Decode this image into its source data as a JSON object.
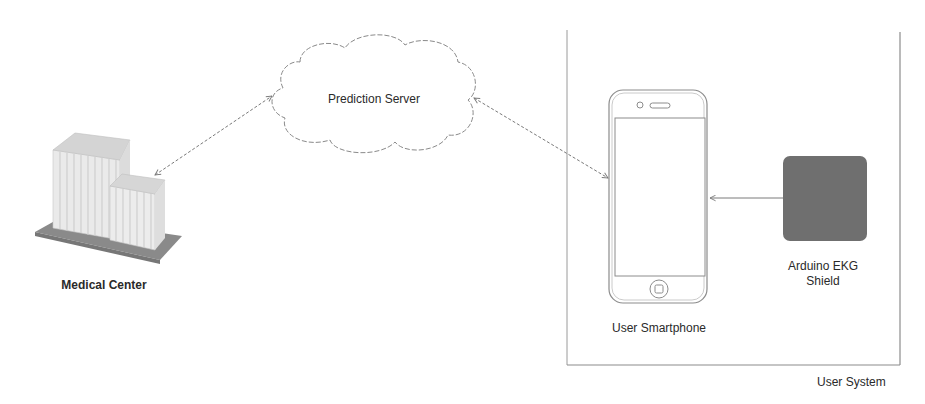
{
  "diagram": {
    "type": "system-architecture",
    "nodes": {
      "prediction_server": {
        "label": "Prediction Server",
        "shape": "cloud"
      },
      "medical_center": {
        "label": "Medical Center",
        "shape": "building-icon"
      },
      "user_smartphone": {
        "label": "User Smartphone",
        "shape": "smartphone-icon"
      },
      "ekg_shield": {
        "label": "Arduino EKG Shield",
        "label_line1": "Arduino EKG",
        "label_line2": "Shield",
        "shape": "rounded-square",
        "fill": "#6f6f6f"
      }
    },
    "groups": {
      "user_system": {
        "label": "User System",
        "contains": [
          "user_smartphone",
          "ekg_shield"
        ]
      }
    },
    "edges": [
      {
        "from": "medical_center",
        "to": "prediction_server",
        "style": "dashed",
        "direction": "bidirectional"
      },
      {
        "from": "prediction_server",
        "to": "user_smartphone",
        "style": "dashed",
        "direction": "bidirectional"
      },
      {
        "from": "ekg_shield",
        "to": "user_smartphone",
        "style": "solid",
        "direction": "forward"
      }
    ],
    "colors": {
      "line": "#7a7a7a",
      "ekg_fill": "#6f6f6f",
      "building_face": "#e4e4e4",
      "building_top": "#d2d2d2",
      "building_base": "#8a8a8a",
      "box_border": "#8c8c8c"
    }
  }
}
